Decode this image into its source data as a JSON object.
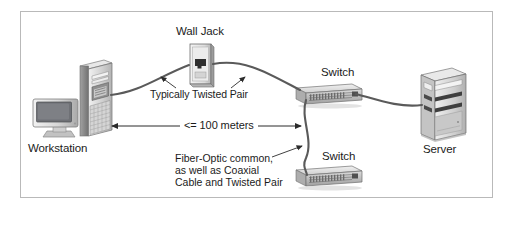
{
  "figure": {
    "border_color": "#b9b9b9",
    "background_color": "#ffffff",
    "text_color": "#1b1b1b"
  },
  "labels": {
    "wall_jack": "Wall Jack",
    "typically_twisted_pair": "Typically Twisted Pair",
    "distance": "<= 100 meters",
    "switch_top": "Switch",
    "switch_bottom": "Switch",
    "server": "Server",
    "workstation": "Workstation"
  },
  "note": {
    "line1": "Fiber-Optic common,",
    "line2": "as well as Coaxial",
    "line3": "Cable and Twisted Pair"
  },
  "devices": [
    {
      "name": "workstation",
      "label": "Workstation",
      "parts": [
        "crt-monitor",
        "tower-pc"
      ]
    },
    {
      "name": "wall-jack",
      "label": "Wall Jack",
      "parts": [
        "faceplate",
        "rj45-port"
      ]
    },
    {
      "name": "switch-top",
      "label": "Switch",
      "parts": [
        "chassis",
        "port-row"
      ]
    },
    {
      "name": "switch-bottom",
      "label": "Switch",
      "parts": [
        "chassis",
        "port-row"
      ]
    },
    {
      "name": "server",
      "label": "Server",
      "parts": [
        "tower-chassis",
        "drive-bays"
      ]
    }
  ],
  "connections": [
    {
      "from": "workstation",
      "to": "wall-jack",
      "media": "Typically Twisted Pair"
    },
    {
      "from": "wall-jack",
      "to": "switch-top",
      "media": "Typically Twisted Pair"
    },
    {
      "from": "switch-top",
      "to": "server",
      "media": ""
    },
    {
      "from": "switch-top",
      "to": "switch-bottom",
      "media": "Fiber-Optic common, as well as Coaxial Cable and Twisted Pair"
    }
  ],
  "measurements": {
    "span_label": "<= 100 meters",
    "span_from": "workstation",
    "span_to": "switch-top"
  },
  "colors": {
    "cable": "#5a5a5a",
    "arrow": "#2b2b2b",
    "device_light": "#e3e3e3",
    "device_mid": "#bfbfbf",
    "device_dark": "#8d8d8d",
    "screen": "#6f7176"
  }
}
